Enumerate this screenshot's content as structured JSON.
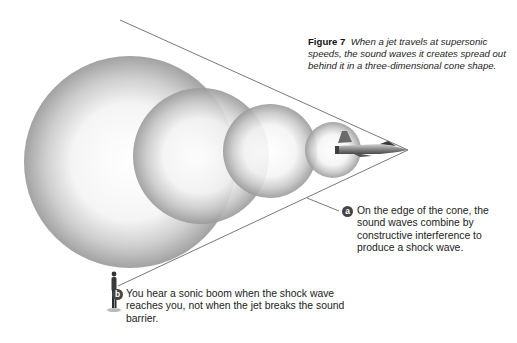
{
  "figure": {
    "label": "Figure 7",
    "caption": "When a jet travels at supersonic speeds, the sound waves it creates spread out behind it in a three-dimensional cone shape."
  },
  "callouts": [
    {
      "badge": "a",
      "text": "On the edge of the cone, the sound waves combine by constructive interference to produce a shock wave."
    },
    {
      "badge": "b",
      "text": "You hear a sonic boom when the shock wave reaches you, not when the jet breaks the sound barrier."
    }
  ],
  "illustration": {
    "objects": [
      "jet-aircraft",
      "sound-wave-spheres",
      "shock-cone",
      "observer-person"
    ],
    "wave_count": 4
  }
}
